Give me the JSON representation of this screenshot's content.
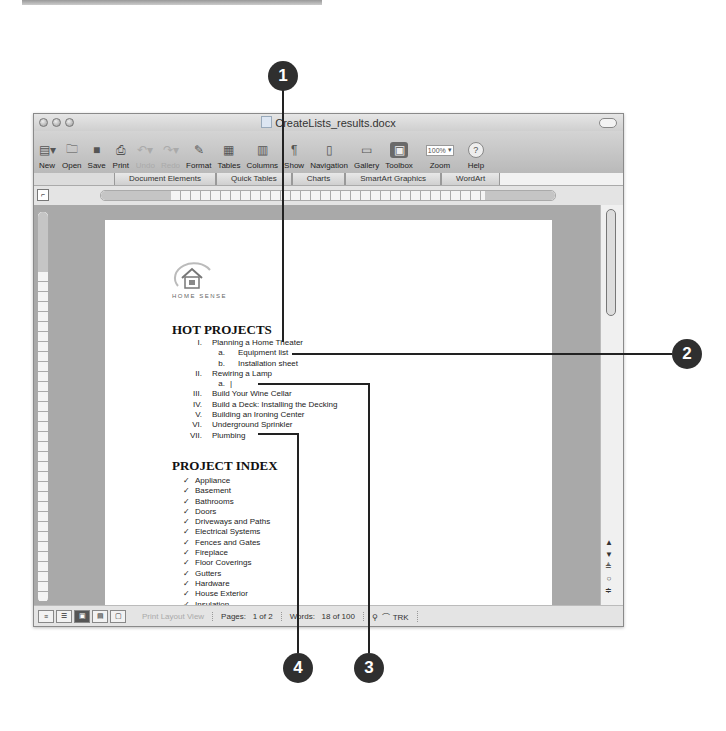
{
  "window": {
    "title": "CreateLists_results.docx"
  },
  "toolbar": {
    "buttons": [
      {
        "label": "New",
        "icon": "new-doc-icon"
      },
      {
        "label": "Open",
        "icon": "open-folder-icon"
      },
      {
        "label": "Save",
        "icon": "floppy-save-icon"
      },
      {
        "label": "Print",
        "icon": "printer-icon"
      },
      {
        "label": "Undo",
        "icon": "undo-icon",
        "disabled": true
      },
      {
        "label": "Redo",
        "icon": "redo-icon",
        "disabled": true
      },
      {
        "label": "Format",
        "icon": "format-painter-icon"
      },
      {
        "label": "Tables",
        "icon": "table-icon"
      },
      {
        "label": "Columns",
        "icon": "columns-icon"
      },
      {
        "label": "Show",
        "icon": "pilcrow-icon"
      },
      {
        "label": "Navigation",
        "icon": "navigation-pane-icon"
      },
      {
        "label": "Gallery",
        "icon": "gallery-icon"
      },
      {
        "label": "Toolbox",
        "icon": "toolbox-icon"
      },
      {
        "label": "Zoom",
        "value": "100%"
      },
      {
        "label": "Help",
        "icon": "help-icon"
      }
    ]
  },
  "ribbon": {
    "tabs": [
      "Document Elements",
      "Quick Tables",
      "Charts",
      "SmartArt Graphics",
      "WordArt"
    ]
  },
  "document": {
    "logo_text": "HOME SENSE",
    "hot_projects": {
      "heading": "HOT PROJECTS",
      "items": [
        {
          "num": "I.",
          "text": "Planning a Home Theater",
          "level": 1
        },
        {
          "num": "a.",
          "text": "Equipment list",
          "level": 2
        },
        {
          "num": "b.",
          "text": "Installation sheet",
          "level": 2
        },
        {
          "num": "II.",
          "text": "Rewiring a Lamp",
          "level": 1
        },
        {
          "num": "a.",
          "text": "|",
          "level": 2
        },
        {
          "num": "III.",
          "text": "Build Your Wine Cellar",
          "level": 1
        },
        {
          "num": "IV.",
          "text": "Build a Deck: Installing the Decking",
          "level": 1
        },
        {
          "num": "V.",
          "text": "Building an Ironing Center",
          "level": 1
        },
        {
          "num": "VI.",
          "text": "Underground Sprinkler",
          "level": 1
        },
        {
          "num": "VII.",
          "text": "Plumbing",
          "level": 1
        }
      ]
    },
    "project_index": {
      "heading": "PROJECT INDEX",
      "bullet": "✓",
      "items": [
        "Appliance",
        "Basement",
        "Bathrooms",
        "Doors",
        "Driveways and Paths",
        "Electrical Systems",
        "Fences and Gates",
        "Fireplace",
        "Floor Coverings",
        "Gutters",
        "Hardware",
        "House Exterior",
        "Insulation"
      ]
    }
  },
  "statusbar": {
    "view_label": "Print Layout View",
    "pages_label": "Pages:",
    "pages_value": "1 of 2",
    "words_label": "Words:",
    "words_value": "18 of 100",
    "track_label": "TRK"
  },
  "callouts": [
    "1",
    "2",
    "3",
    "4"
  ]
}
